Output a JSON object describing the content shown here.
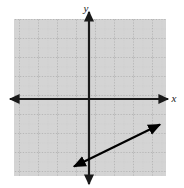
{
  "figure": {
    "title": "",
    "background_color": "#ffffff",
    "width": 184,
    "height": 188
  },
  "axes": {
    "x_label": "x",
    "y_label": "y",
    "axis_color": "#1a1a1a",
    "origin_px": {
      "x": 89,
      "y": 99
    }
  },
  "grid": {
    "fill_color": "#d4d4d4",
    "minor_line_color": "#bdbdbd",
    "major_line_color": "#a8a8a8",
    "cell_size_px": 19,
    "minor_cell_size_px": 9.5,
    "left_px": 14,
    "top_px": 19,
    "right_px": 166,
    "bottom_px": 176
  },
  "chart_data": {
    "type": "line",
    "title": "",
    "xlabel": "x",
    "ylabel": "y",
    "grid": true,
    "legend": "none",
    "xlim": [
      -4,
      4
    ],
    "ylim": [
      -4,
      4
    ],
    "x_tick_labels": [],
    "y_tick_labels": [],
    "annotations": [],
    "series": [
      {
        "name": "line",
        "style": "double-headed-arrow",
        "color": "#000000",
        "slope": 0.5,
        "y_intercept": -2.5,
        "x": [
          -0.85,
          3.8
        ],
        "y": [
          -2.9,
          -1.1
        ],
        "endpoints_px": [
          {
            "x": 73,
            "y": 167
          },
          {
            "x": 161,
            "y": 124
          }
        ]
      }
    ]
  }
}
